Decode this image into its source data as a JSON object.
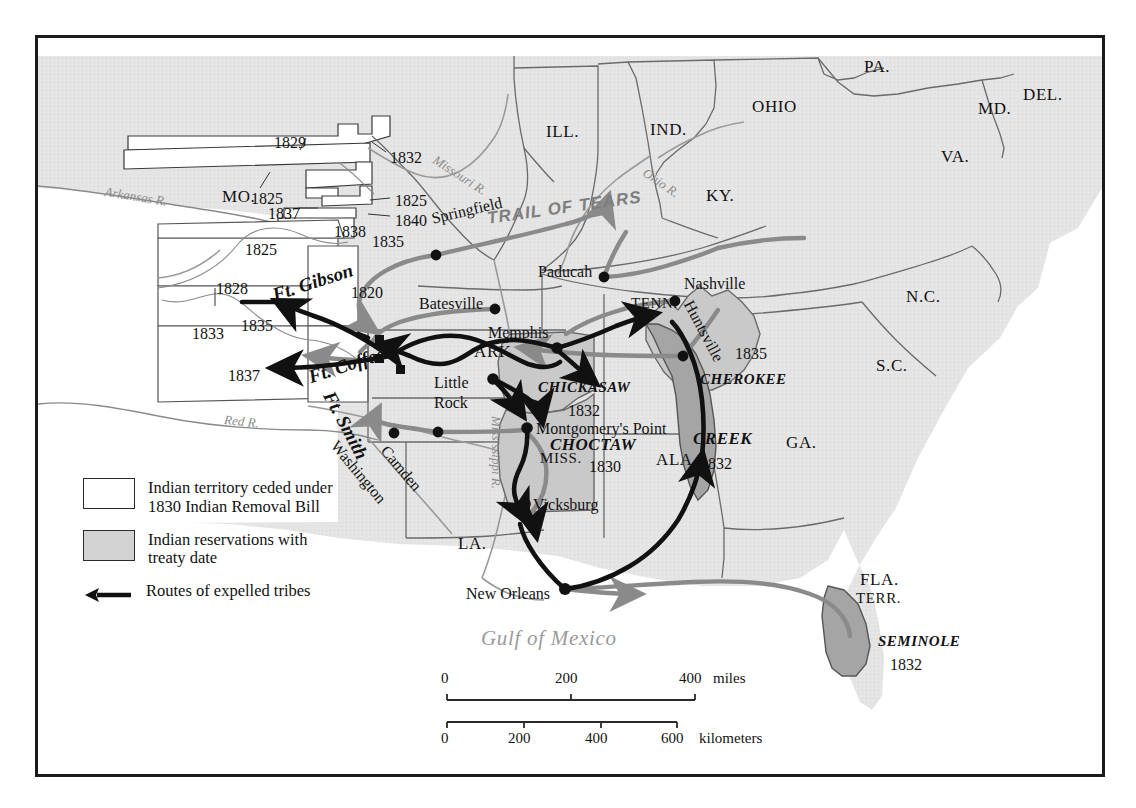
{
  "map": {
    "title": "Indian Removal 1830s",
    "gulf_label": "Gulf of Mexico",
    "trail_label": "TRAIL OF TEARS",
    "colors": {
      "land": "#e4e4e4",
      "water": "#ffffff",
      "ceded": "#ffffff",
      "reservation_light": "#c9c9c9",
      "reservation_dark": "#a5a5a5",
      "route_black": "#111111",
      "route_gray": "#8a8a8a",
      "border": "#1a1a1a"
    }
  },
  "states": [
    {
      "label": "ILL.",
      "x": 508,
      "y": 85
    },
    {
      "label": "IND.",
      "x": 612,
      "y": 83
    },
    {
      "label": "OHIO",
      "x": 714,
      "y": 60
    },
    {
      "label": "PA.",
      "x": 826,
      "y": 20
    },
    {
      "label": "MD.",
      "x": 940,
      "y": 62
    },
    {
      "label": "DEL.",
      "x": 985,
      "y": 48
    },
    {
      "label": "VA.",
      "x": 903,
      "y": 110
    },
    {
      "label": "KY.",
      "x": 668,
      "y": 149
    },
    {
      "label": "MO.",
      "x": 184,
      "y": 150
    },
    {
      "label": "TENN.",
      "x": 593,
      "y": 258
    },
    {
      "label": "N.C.",
      "x": 868,
      "y": 250
    },
    {
      "label": "S.C.",
      "x": 838,
      "y": 319
    },
    {
      "label": "GA.",
      "x": 748,
      "y": 396
    },
    {
      "label": "ARK.",
      "x": 436,
      "y": 305
    },
    {
      "label": "MISS.",
      "x": 502,
      "y": 413
    },
    {
      "label": "ALA.",
      "x": 618,
      "y": 413
    },
    {
      "label": "LA.",
      "x": 420,
      "y": 497
    },
    {
      "label": "FLA.",
      "x": 822,
      "y": 533
    },
    {
      "label": "TERR.",
      "x": 818,
      "y": 553
    }
  ],
  "cities": [
    {
      "label": "Springfield",
      "x": 392,
      "y": 173,
      "dx": 0,
      "dy": 0,
      "rot": -13,
      "dot": [
        398,
        217
      ]
    },
    {
      "label": "Batesville",
      "x": 381,
      "y": 258,
      "dot": [
        457,
        271
      ]
    },
    {
      "label": "Paducah",
      "x": 500,
      "y": 226,
      "dot": [
        566,
        239
      ]
    },
    {
      "label": "Nashville",
      "x": 646,
      "y": 238,
      "dot": [
        637,
        263
      ]
    },
    {
      "label": "Huntsville",
      "x": 657,
      "y": 260,
      "rot": 62,
      "dot": [
        645,
        318
      ]
    },
    {
      "label": "Memphis",
      "x": 450,
      "y": 287,
      "dot": [
        519,
        310
      ]
    },
    {
      "label": "Little",
      "x": 396,
      "y": 337,
      "dot": [
        455,
        341
      ]
    },
    {
      "label": "Rock",
      "x": 396,
      "y": 357
    },
    {
      "label": "Montgomery's Point",
      "x": 498,
      "y": 383,
      "dot": [
        489,
        390
      ]
    },
    {
      "label": "Vicksburg",
      "x": 495,
      "y": 459,
      "dot": [
        487,
        466
      ]
    },
    {
      "label": "New Orleans",
      "x": 428,
      "y": 548,
      "dot": [
        527,
        551
      ]
    },
    {
      "label": "Washington",
      "x": 302,
      "y": 400,
      "rot": 50,
      "dot": [
        356,
        395
      ]
    },
    {
      "label": "Camden",
      "x": 352,
      "y": 405,
      "rot": 50,
      "dot": [
        400,
        394
      ]
    }
  ],
  "forts": [
    {
      "label": "Ft. Gibson",
      "x": 232,
      "y": 248,
      "rot": -18,
      "marker": [
        341,
        301
      ]
    },
    {
      "label": "Ft. Coffee",
      "x": 268,
      "y": 330,
      "rot": -18,
      "marker": [
        341,
        320
      ]
    },
    {
      "label": "Ft. Smith",
      "x": 299,
      "y": 350,
      "rot": 62,
      "marker": [
        362,
        331
      ]
    }
  ],
  "ceded_years": [
    {
      "year": "1829",
      "x": 236,
      "y": 97
    },
    {
      "year": "1832",
      "x": 352,
      "y": 112
    },
    {
      "year": "1825",
      "x": 213,
      "y": 153
    },
    {
      "year": "1825",
      "x": 357,
      "y": 155
    },
    {
      "year": "1837",
      "x": 230,
      "y": 168
    },
    {
      "year": "1840",
      "x": 357,
      "y": 175
    },
    {
      "year": "1838",
      "x": 296,
      "y": 186
    },
    {
      "year": "1835",
      "x": 334,
      "y": 196
    },
    {
      "year": "1825",
      "x": 207,
      "y": 204
    },
    {
      "year": "1828",
      "x": 178,
      "y": 243
    },
    {
      "year": "1820",
      "x": 313,
      "y": 247
    },
    {
      "year": "1835",
      "x": 203,
      "y": 280
    },
    {
      "year": "1833",
      "x": 154,
      "y": 288
    },
    {
      "year": "1837",
      "x": 190,
      "y": 330
    }
  ],
  "reservations": [
    {
      "name": "CHICKASAW",
      "year": "1832",
      "nx": 500,
      "ny": 342,
      "yx": 530,
      "yy": 365
    },
    {
      "name": "CHOCTAW",
      "year": "1830",
      "nx": 512,
      "ny": 398,
      "yx": 551,
      "yy": 421
    },
    {
      "name": "CHEROKEE",
      "year": "1835",
      "nx": 662,
      "ny": 334,
      "yx": 697,
      "yy": 308
    },
    {
      "name": "CREEK",
      "year": "1832",
      "nx": 655,
      "ny": 392,
      "yx": 662,
      "yy": 418
    },
    {
      "name": "SEMINOLE",
      "year": "1832",
      "nx": 840,
      "ny": 596,
      "yx": 852,
      "yy": 619
    }
  ],
  "rivers": [
    {
      "label": "Arkansas R.",
      "x": 68,
      "y": 147,
      "rot": 9
    },
    {
      "label": "Missouri R.",
      "x": 400,
      "y": 115,
      "rot": 33
    },
    {
      "label": "Ohio R.",
      "x": 610,
      "y": 128,
      "rot": 34
    },
    {
      "label": "Red R.",
      "x": 187,
      "y": 375,
      "rot": 6
    },
    {
      "label": "Mississippi R.",
      "x": 465,
      "y": 378,
      "rot": 90
    }
  ],
  "legend": {
    "items": [
      {
        "icon": "ceded-swatch",
        "text": "Indian territory ceded under\n1830 Indian Removal Bill"
      },
      {
        "icon": "reservation-swatch",
        "text": "Indian reservations with\ntreaty date"
      },
      {
        "icon": "route-arrow",
        "text": "Routes of expelled tribes"
      }
    ]
  },
  "scale": {
    "miles": {
      "ticks": [
        "0",
        "200",
        "400"
      ],
      "unit": "miles"
    },
    "kilometers": {
      "ticks": [
        "0",
        "200",
        "400",
        "600"
      ],
      "unit": "kilometers"
    }
  }
}
